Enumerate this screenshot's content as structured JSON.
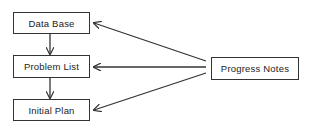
{
  "diagram": {
    "nodes": [
      {
        "id": "data_base",
        "label": "Data Base"
      },
      {
        "id": "problem_list",
        "label": "Problem List"
      },
      {
        "id": "initial_plan",
        "label": "Initial Plan"
      },
      {
        "id": "progress_notes",
        "label": "Progress Notes"
      }
    ],
    "edges": [
      {
        "from": "data_base",
        "to": "problem_list"
      },
      {
        "from": "problem_list",
        "to": "initial_plan"
      },
      {
        "from": "progress_notes",
        "to": "data_base"
      },
      {
        "from": "progress_notes",
        "to": "problem_list"
      },
      {
        "from": "progress_notes",
        "to": "initial_plan"
      }
    ],
    "colors": {
      "stroke": "#333333",
      "background": "#ffffff",
      "text": "#222222"
    }
  }
}
